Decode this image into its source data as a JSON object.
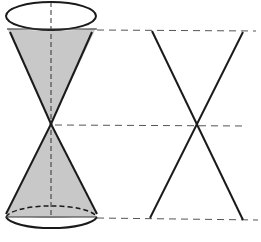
{
  "diagram": {
    "title": "",
    "colors": {
      "background": "#ffffff",
      "stroke": "#1a1a1a",
      "cone_fill": "#c8c8c8",
      "dash": "#555555"
    },
    "double_cone": {
      "top_ellipse": {
        "cx": 51,
        "cy": 16,
        "rx": 45,
        "ry": 14
      },
      "top_chord_y": 29,
      "apex": {
        "x": 51,
        "y": 124
      },
      "upper_left_rim": {
        "x": 9,
        "y": 32
      },
      "upper_right_rim": {
        "x": 93,
        "y": 32
      },
      "bottom_ellipse": {
        "cx": 51,
        "cy": 217,
        "rx": 46,
        "ry": 13
      },
      "bottom_chord_y": 217,
      "axis": {
        "x": 51,
        "y1": 2,
        "y2": 217
      }
    },
    "guide_lines": [
      {
        "name": "top-guide",
        "x1": 97,
        "y1": 30,
        "x2": 256,
        "y2": 31
      },
      {
        "name": "middle-guide",
        "x1": 55,
        "y1": 125,
        "x2": 246,
        "y2": 126
      },
      {
        "name": "bottom-guide",
        "x1": 97,
        "y1": 218,
        "x2": 258,
        "y2": 220
      }
    ],
    "cross_section": {
      "line_a": {
        "x1": 152,
        "y1": 31,
        "x2": 243,
        "y2": 220
      },
      "line_b": {
        "x1": 243,
        "y1": 32,
        "x2": 150,
        "y2": 218
      },
      "intersection": {
        "x": 198,
        "y": 125
      }
    }
  }
}
